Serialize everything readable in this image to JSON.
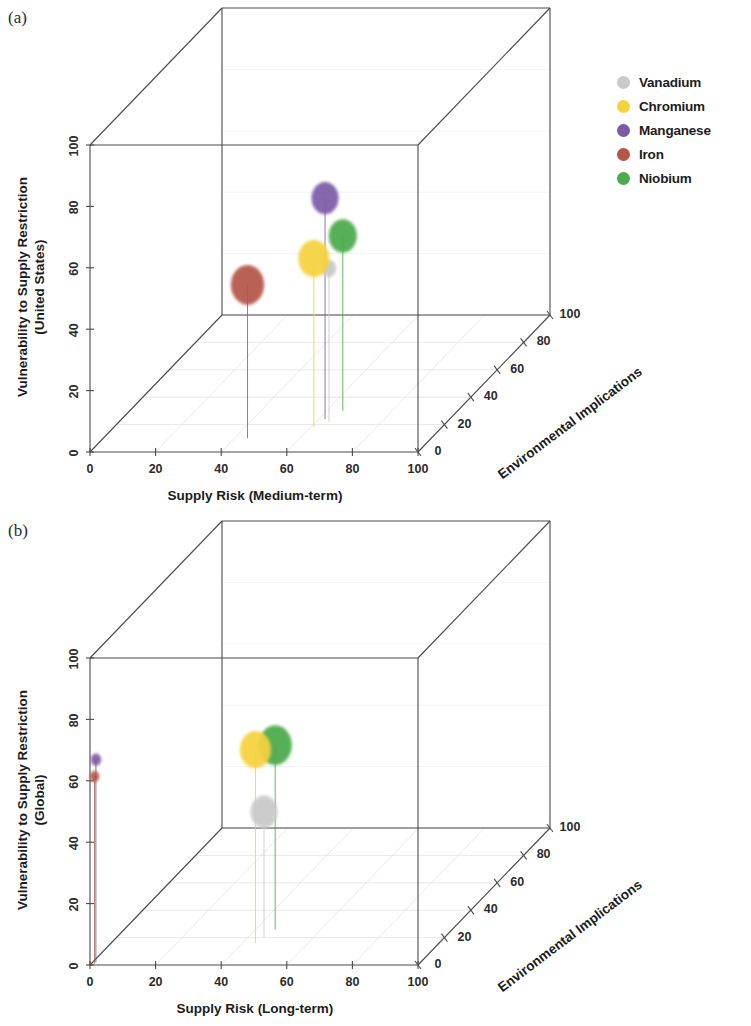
{
  "figure": {
    "panels": [
      {
        "tag": "(a)",
        "x_axis": {
          "title": "Supply Risk (Medium-term)",
          "ticks": [
            0,
            20,
            40,
            60,
            80,
            100
          ],
          "min": 0,
          "max": 100
        },
        "y_axis": {
          "title_line1": "Vulnerability to Supply Restriction",
          "title_line2": "(United States)",
          "ticks": [
            0,
            20,
            40,
            60,
            80,
            100
          ],
          "min": 0,
          "max": 100
        },
        "z_axis": {
          "title": "Environmental Implications",
          "ticks": [
            0,
            20,
            40,
            60,
            80,
            100
          ],
          "min": 0,
          "max": 100
        }
      },
      {
        "tag": "(b)",
        "x_axis": {
          "title": "Supply Risk (Long-term)",
          "ticks": [
            0,
            20,
            40,
            60,
            80,
            100
          ],
          "min": 0,
          "max": 100
        },
        "y_axis": {
          "title_line1": "Vulnerability to Supply Restriction",
          "title_line2": "(Global)",
          "ticks": [
            0,
            20,
            40,
            60,
            80,
            100
          ],
          "min": 0,
          "max": 100
        },
        "z_axis": {
          "title": "Environmental Implications",
          "ticks": [
            0,
            20,
            40,
            60,
            80,
            100
          ],
          "min": 0,
          "max": 100
        }
      }
    ],
    "legend": {
      "entries": [
        {
          "label": "Vanadium",
          "color": "#c9c9c9"
        },
        {
          "label": "Chromium",
          "color": "#f6d23c"
        },
        {
          "label": "Manganese",
          "color": "#7b5ba8"
        },
        {
          "label": "Iron",
          "color": "#b4564a"
        },
        {
          "label": "Niobium",
          "color": "#4caa4c"
        }
      ]
    }
  },
  "chart_data": [
    {
      "type": "scatter",
      "panel": "(a)",
      "title": "",
      "xlabel": "Supply Risk (Medium-term)",
      "ylabel": "Vulnerability to Supply Restriction (United States)",
      "zlabel": "Environmental Implications",
      "xlim": [
        0,
        100
      ],
      "ylim": [
        0,
        100
      ],
      "zlim": [
        0,
        100
      ],
      "grid": true,
      "legend_position": "right",
      "series": [
        {
          "name": "Vanadium",
          "color": "#c9c9c9",
          "x": 64,
          "y": 50,
          "z": 22,
          "size": 14
        },
        {
          "name": "Chromium",
          "color": "#f6d23c",
          "x": 61,
          "y": 55,
          "z": 18,
          "size": 30
        },
        {
          "name": "Manganese",
          "color": "#7b5ba8",
          "x": 62,
          "y": 72,
          "z": 24,
          "size": 26
        },
        {
          "name": "Iron",
          "color": "#b4564a",
          "x": 44,
          "y": 50,
          "z": 10,
          "size": 32
        },
        {
          "name": "Niobium",
          "color": "#4caa4c",
          "x": 65,
          "y": 57,
          "z": 30,
          "size": 27
        }
      ]
    },
    {
      "type": "scatter",
      "panel": "(b)",
      "title": "",
      "xlabel": "Supply Risk (Long-term)",
      "ylabel": "Vulnerability to Supply Restriction (Global)",
      "zlabel": "Environmental Implications",
      "xlim": [
        0,
        100
      ],
      "ylim": [
        0,
        100
      ],
      "zlim": [
        0,
        100
      ],
      "grid": true,
      "legend_position": "right",
      "series": [
        {
          "name": "Vanadium",
          "color": "#c9c9c9",
          "x": 45,
          "y": 41,
          "z": 20,
          "size": 26
        },
        {
          "name": "Chromium",
          "color": "#f6d23c",
          "x": 44,
          "y": 63,
          "z": 16,
          "size": 30
        },
        {
          "name": "Manganese",
          "color": "#7b5ba8",
          "x": 1,
          "y": 66,
          "z": 2,
          "size": 10
        },
        {
          "name": "Iron",
          "color": "#b4564a",
          "x": 1,
          "y": 61,
          "z": 1,
          "size": 9
        },
        {
          "name": "Niobium",
          "color": "#4caa4c",
          "x": 46,
          "y": 60,
          "z": 26,
          "size": 32
        }
      ]
    }
  ]
}
